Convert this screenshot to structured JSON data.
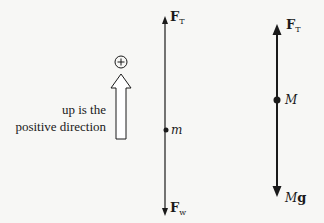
{
  "diagram": {
    "direction_note": {
      "line1": "up is the",
      "line2": "positive direction",
      "sign_symbol": "+"
    },
    "left_fbd": {
      "mass_label": "m",
      "top_force": {
        "main": "F",
        "sub": "T"
      },
      "bottom_force": {
        "main": "F",
        "sub": "w"
      }
    },
    "right_fbd": {
      "mass_label": "M",
      "top_force": {
        "main": "F",
        "sub": "T"
      },
      "bottom_force": {
        "main_italic": "M",
        "main_bold": "g"
      }
    },
    "colors": {
      "ink": "#1a1a1a",
      "background": "#f7f7f5"
    }
  }
}
